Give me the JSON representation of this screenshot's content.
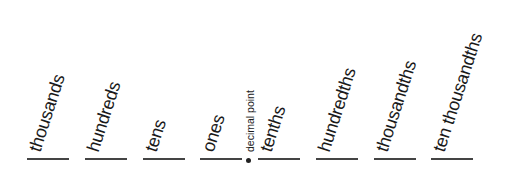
{
  "diagram": {
    "places": [
      {
        "label": "thousands"
      },
      {
        "label": "hundreds"
      },
      {
        "label": "tens"
      },
      {
        "label": "ones"
      },
      {
        "label": "tenths"
      },
      {
        "label": "hundredths"
      },
      {
        "label": "thousandths"
      },
      {
        "label": "ten thousandths"
      }
    ],
    "decimal_point_label": "decimal point"
  }
}
